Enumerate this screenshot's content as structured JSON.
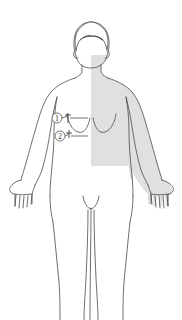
{
  "figure": {
    "view": "anterior",
    "background_color": "#ffffff",
    "outline_color": "#4a4a4a",
    "shade_color": "#e0e0e0",
    "shade_label": "shaded region",
    "shade_description": "gray rectangular shaded area over right chest, torso and arm"
  },
  "markers": [
    {
      "id": "marker-1",
      "label": "①",
      "number": "1",
      "target": "upper breast landmark",
      "circle": {
        "cx": 57,
        "cy": 118,
        "r": 5
      },
      "point": {
        "x": 68,
        "y": 116
      },
      "leader_end": {
        "x": 88,
        "y": 118
      }
    },
    {
      "id": "marker-2",
      "label": "②",
      "number": "2",
      "target": "lower breast landmark",
      "circle": {
        "cx": 60,
        "cy": 136,
        "r": 5
      },
      "point": {
        "x": 69,
        "y": 133
      },
      "leader_end": {
        "x": 88,
        "y": 136
      }
    }
  ],
  "regions": {
    "head": "head",
    "hair": "hair",
    "ear_left": "left ear",
    "ear_right": "right ear",
    "neck": "neck",
    "shoulder_left": "left shoulder",
    "shoulder_right": "right shoulder",
    "arm_left": "left arm",
    "arm_right": "right arm",
    "hand_left": "left hand",
    "hand_right": "right hand",
    "breast_left": "left breast",
    "breast_right": "right breast",
    "torso": "torso",
    "pelvis": "pelvis",
    "leg_left": "left leg",
    "leg_right": "right leg"
  }
}
